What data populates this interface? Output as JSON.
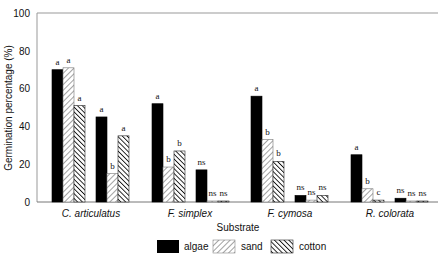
{
  "chart_data": {
    "type": "bar",
    "title": "",
    "xlabel": "Substrate",
    "ylabel": "Germination percentage (%)",
    "ylim": [
      0,
      100
    ],
    "yticks": [
      0,
      20,
      40,
      60,
      80,
      100
    ],
    "grid": false,
    "legend_position": "bottom",
    "categories": [
      "C. articulatus",
      "F. simplex",
      "F. cymosa",
      "R. colorata"
    ],
    "subgroups_per_category": 2,
    "series": [
      {
        "name": "algae",
        "pattern": "solid-black",
        "values": [
          [
            70,
            45
          ],
          [
            52,
            17
          ],
          [
            56,
            3.5
          ],
          [
            25,
            2
          ]
        ],
        "labels": [
          [
            "a",
            "a"
          ],
          [
            "a",
            "ns"
          ],
          [
            "a",
            "ns"
          ],
          [
            "a",
            "ns"
          ]
        ]
      },
      {
        "name": "sand",
        "pattern": "diagonal-hatch-light",
        "values": [
          [
            71,
            15
          ],
          [
            18.5,
            0.5
          ],
          [
            33,
            1
          ],
          [
            7,
            0.5
          ]
        ],
        "labels": [
          [
            "a",
            "b"
          ],
          [
            "b",
            "ns"
          ],
          [
            "b",
            "ns"
          ],
          [
            "b",
            "ns"
          ]
        ]
      },
      {
        "name": "cotton",
        "pattern": "diagonal-hatch-dense",
        "values": [
          [
            51,
            35
          ],
          [
            27,
            0.5
          ],
          [
            21.5,
            3.5
          ],
          [
            1,
            0.5
          ]
        ],
        "labels": [
          [
            "a",
            "a"
          ],
          [
            "b",
            "ns"
          ],
          [
            "b",
            "ns"
          ],
          [
            "c",
            "ns"
          ]
        ]
      }
    ]
  },
  "axis": {
    "y_label": "Germination percentage (%)",
    "x_label": "Substrate",
    "y_ticks": [
      "0",
      "20",
      "40",
      "60",
      "80",
      "100"
    ]
  },
  "categories": [
    "C. articulatus",
    "F. simplex",
    "F. cymosa",
    "R. colorata"
  ],
  "legend": {
    "items": [
      {
        "label": "algae"
      },
      {
        "label": "sand"
      },
      {
        "label": "cotton"
      }
    ]
  }
}
